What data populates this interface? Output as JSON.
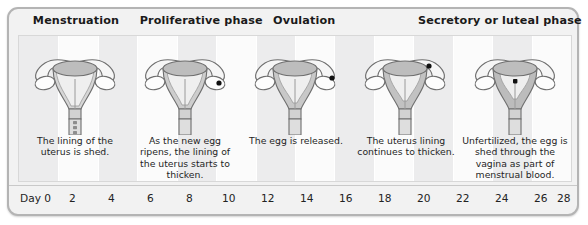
{
  "figure": {
    "colors": {
      "frame_border": "#b4b4b4",
      "background": "#f2f2f2",
      "panel": "#fbfbfb",
      "band": "#ececed",
      "text": "#1a1a1a",
      "organ_outline": "#6e6e6e",
      "lining": "#9a9a9a",
      "egg": "#111111"
    }
  },
  "phases": [
    {
      "label": "Menstruation",
      "left_pct": 4.2
    },
    {
      "label": "Proliferative phase",
      "left_pct": 23.0
    },
    {
      "label": "Ovulation",
      "left_pct": 46.5
    },
    {
      "label": "Secretory or luteal phase",
      "left_pct": 72.0
    }
  ],
  "stages": [
    {
      "name": "menstruation",
      "caption": "The lining of the uterus is shed.",
      "lining": "thin-shedding",
      "egg_location": "none"
    },
    {
      "name": "proliferative",
      "caption": "As the new egg ripens, the lining of the uterus starts to thicken.",
      "lining": "thickening",
      "egg_location": "right-ovary"
    },
    {
      "name": "ovulation",
      "caption": "The egg is released.",
      "lining": "medium",
      "egg_location": "ovary-edge"
    },
    {
      "name": "luteal-early",
      "caption": "The uterus lining continues to thicken.",
      "lining": "thick",
      "egg_location": "fallopian-tube"
    },
    {
      "name": "luteal-late",
      "caption": "Unfertilized, the egg is shed through the vagina as part of menstrual blood.",
      "lining": "thickest",
      "egg_location": "uterine-cavity"
    }
  ],
  "day_axis": {
    "label": "Day",
    "ticks": [
      "0",
      "2",
      "4",
      "6",
      "8",
      "10",
      "12",
      "14",
      "16",
      "18",
      "20",
      "22",
      "24",
      "26",
      "28"
    ],
    "min": 0,
    "max": 28,
    "step": 2
  }
}
